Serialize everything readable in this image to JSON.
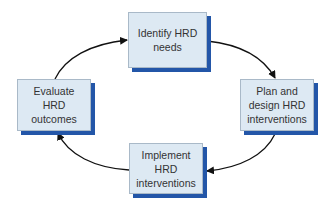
{
  "diagram": {
    "type": "cycle",
    "colors": {
      "box_fill": "#dde9f3",
      "box_border": "#a9b9c8",
      "box_shadow": "#2356a8",
      "arrow": "#111111",
      "text": "#333333"
    },
    "nodes": [
      {
        "id": "identify",
        "lines": [
          "Identify HRD",
          "needs"
        ]
      },
      {
        "id": "plan",
        "lines": [
          "Plan and",
          "design HRD",
          "interventions"
        ]
      },
      {
        "id": "implement",
        "lines": [
          "Implement",
          "HRD",
          "interventions"
        ]
      },
      {
        "id": "evaluate",
        "lines": [
          "Evaluate",
          "HRD",
          "outcomes"
        ]
      }
    ],
    "edges": [
      {
        "from": "identify",
        "to": "plan"
      },
      {
        "from": "plan",
        "to": "implement"
      },
      {
        "from": "implement",
        "to": "evaluate"
      },
      {
        "from": "evaluate",
        "to": "identify"
      }
    ]
  }
}
